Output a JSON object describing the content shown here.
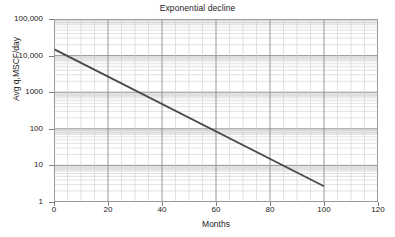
{
  "chart_data": {
    "type": "line",
    "title": "Exponential decline",
    "xlabel": "Months",
    "ylabel": "Avg q,MSCF/day",
    "xscale": "linear",
    "yscale": "log",
    "xlim": [
      0,
      120
    ],
    "ylim": [
      1,
      100000
    ],
    "grid": true,
    "legend": "none",
    "x_ticks": [
      0,
      20,
      40,
      60,
      80,
      100,
      120
    ],
    "x_tick_labels": [
      "0",
      "20",
      "40",
      "60",
      "80",
      "100",
      "120"
    ],
    "x_minor_step": 5,
    "y_ticks": [
      1,
      10,
      100,
      1000,
      10000,
      100000
    ],
    "y_tick_labels": [
      "1",
      "10",
      "100",
      "1000",
      "10,000",
      "100,000"
    ],
    "series": [
      {
        "name": "Exponential decline",
        "color": "#4a4a4a",
        "x": [
          0,
          10,
          20,
          30,
          40,
          50,
          60,
          70,
          80,
          90,
          100
        ],
        "y": [
          15000,
          8200,
          4500,
          2450,
          1340,
          735,
          400,
          220,
          120,
          65,
          2.7
        ],
        "endpoints": [
          {
            "x": 0,
            "y": 15000
          },
          {
            "x": 100,
            "y": 2.7
          }
        ]
      }
    ]
  },
  "figure": {
    "title": "Exponential decline",
    "xlabel": "Months",
    "ylabel": "Avg q,MSCF/day"
  },
  "colors": {
    "line": "#4a4a4a",
    "major_grid": "#8c8c8c",
    "minor_grid": "#cfcfcf",
    "band": "#e4e4e4",
    "frame": "#9a9a9a",
    "text": "#222222"
  }
}
